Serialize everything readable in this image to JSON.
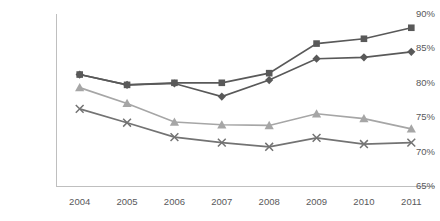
{
  "chart_data": {
    "type": "line",
    "title": "",
    "subtitle": "",
    "xlabel": "",
    "ylabel": "",
    "categories": [
      "2004",
      "2005",
      "2006",
      "2007",
      "2008",
      "2009",
      "2010",
      "2011"
    ],
    "x": [
      2004,
      2005,
      2006,
      2007,
      2008,
      2009,
      2010,
      2011
    ],
    "ylim": [
      65,
      90
    ],
    "yticks": [
      65,
      70,
      75,
      80,
      85,
      90
    ],
    "ytick_labels": [
      "65%",
      "70%",
      "75%",
      "80%",
      "85%",
      "90%"
    ],
    "xtick_labels": [
      "2004",
      "2005",
      "2006",
      "2007",
      "2008",
      "2009",
      "2010",
      "2011"
    ],
    "grid": false,
    "legend": "none",
    "axis_color": "#bfbfbf",
    "tick_label_color": "#59595b",
    "series": [
      {
        "name": "series-1-square",
        "marker": "square",
        "color": "#595959",
        "values": [
          81.2,
          79.7,
          80.0,
          80.0,
          81.4,
          85.7,
          86.4,
          88.0
        ]
      },
      {
        "name": "series-2-diamond",
        "marker": "diamond",
        "color": "#595959",
        "values": [
          81.2,
          79.7,
          79.9,
          78.0,
          80.4,
          83.5,
          83.7,
          84.5
        ]
      },
      {
        "name": "series-3-triangle",
        "marker": "triangle",
        "color": "#a6a6a6",
        "values": [
          79.3,
          77.0,
          74.3,
          73.9,
          73.8,
          75.5,
          74.8,
          73.3
        ]
      },
      {
        "name": "series-4-cross",
        "marker": "cross",
        "color": "#737373",
        "values": [
          76.2,
          74.2,
          72.1,
          71.3,
          70.7,
          72.0,
          71.1,
          71.3
        ]
      }
    ]
  }
}
